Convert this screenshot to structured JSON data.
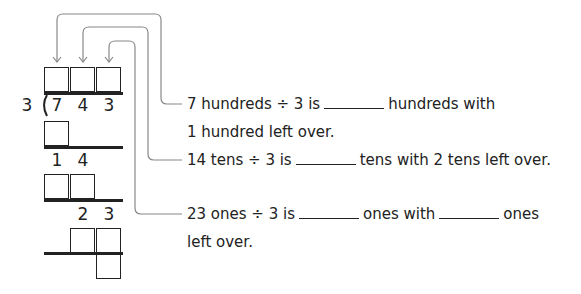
{
  "division": {
    "divisor": "3",
    "dividend_digits": [
      "7",
      "4",
      "3"
    ],
    "step2_digits": [
      "1",
      "4"
    ],
    "step3_digits": [
      "2",
      "3"
    ]
  },
  "statements": [
    {
      "line1_prefix": "7 hundreds ÷ 3 is",
      "line1_suffix": "hundreds with",
      "line2": "1 hundred left over."
    },
    {
      "line1_prefix": "14 tens ÷ 3 is",
      "line1_suffix": "tens with 2 tens left over."
    },
    {
      "line1_prefix": "23 ones ÷ 3 is",
      "line1_mid": "ones with",
      "line1_suffix": "ones",
      "line2": "left over."
    }
  ],
  "colors": {
    "ink": "#222222",
    "connector": "#888888"
  }
}
